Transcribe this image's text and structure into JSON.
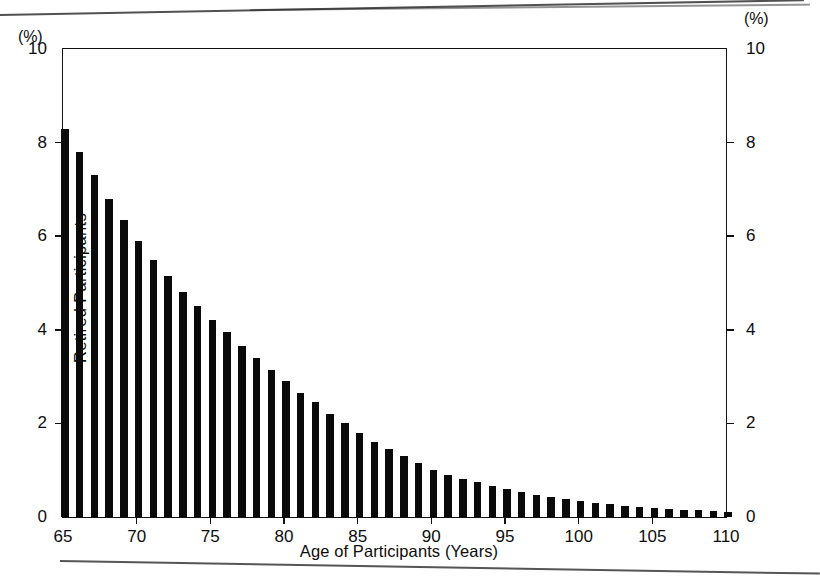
{
  "figure": {
    "background_color": "#ffffff",
    "ink_color": "#0a0a0a",
    "unit_label_left": "(%)",
    "unit_label_right": "(%)"
  },
  "chart_data": {
    "type": "bar",
    "title": "",
    "subtitle": "",
    "xlabel": "Age of Participants (Years)",
    "ylabel": "Retired Participants",
    "y_unit": "(%)",
    "y_unit_right": "(%)",
    "xlim": [
      65,
      110
    ],
    "ylim": [
      0,
      10
    ],
    "yticks": [
      0,
      2,
      4,
      6,
      8,
      10
    ],
    "ytick_labels": [
      "0",
      "2",
      "4",
      "6",
      "8",
      "10"
    ],
    "yticks_right": [
      0,
      2,
      4,
      6,
      8,
      10
    ],
    "ytick_labels_right": [
      "0",
      "2",
      "4",
      "6",
      "8",
      "10"
    ],
    "xticks": [
      65,
      70,
      75,
      80,
      85,
      90,
      95,
      100,
      105,
      110
    ],
    "xtick_labels": [
      "65",
      "70",
      "75",
      "80",
      "85",
      "90",
      "95",
      "100",
      "105",
      "110"
    ],
    "grid": false,
    "legend": null,
    "bar_color": "#0a0a0a",
    "categories": [
      65,
      66,
      67,
      68,
      69,
      70,
      71,
      72,
      73,
      74,
      75,
      76,
      77,
      78,
      79,
      80,
      81,
      82,
      83,
      84,
      85,
      86,
      87,
      88,
      89,
      90,
      91,
      92,
      93,
      94,
      95,
      96,
      97,
      98,
      99,
      100,
      101,
      102,
      103,
      104,
      105,
      106,
      107,
      108,
      109,
      110
    ],
    "values": [
      8.3,
      7.8,
      7.3,
      6.8,
      6.35,
      5.9,
      5.5,
      5.15,
      4.8,
      4.5,
      4.2,
      3.95,
      3.65,
      3.4,
      3.15,
      2.9,
      2.65,
      2.45,
      2.2,
      2.0,
      1.8,
      1.6,
      1.45,
      1.3,
      1.15,
      1.0,
      0.9,
      0.82,
      0.74,
      0.66,
      0.6,
      0.54,
      0.48,
      0.43,
      0.38,
      0.34,
      0.3,
      0.27,
      0.24,
      0.22,
      0.2,
      0.18,
      0.16,
      0.14,
      0.12,
      0.1
    ]
  }
}
